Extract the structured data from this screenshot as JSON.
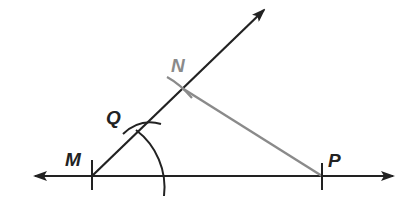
{
  "diagram": {
    "type": "geometric-construction",
    "colors": {
      "primary_stroke": "#222222",
      "secondary_stroke": "#8a8a8a",
      "label_dark": "#222222",
      "label_gray": "#8a8a8a",
      "background": "#ffffff"
    },
    "points": [
      {
        "id": "M",
        "label": "M",
        "x": 92,
        "y": 176,
        "color": "dark"
      },
      {
        "id": "Q",
        "label": "Q",
        "x": 143,
        "y": 124,
        "color": "dark"
      },
      {
        "id": "N",
        "label": "N",
        "x": 182,
        "y": 88,
        "color": "gray"
      },
      {
        "id": "P",
        "label": "P",
        "x": 322,
        "y": 176,
        "color": "dark"
      }
    ],
    "labels": {
      "M": "M",
      "Q": "Q",
      "N": "N",
      "P": "P"
    },
    "lines": [
      {
        "id": "horizontal-line",
        "from": [
          33,
          176
        ],
        "to": [
          395,
          176
        ],
        "arrows": "both"
      },
      {
        "id": "ray-MN",
        "from": [
          92,
          176
        ],
        "to": [
          265,
          8
        ],
        "arrows": "end"
      },
      {
        "id": "segment-NP",
        "from": [
          182,
          88
        ],
        "to": [
          322,
          176
        ],
        "color": "gray"
      }
    ],
    "arcs": [
      {
        "id": "arc-from-M",
        "center": "M",
        "radius": 72,
        "description": "compass arc through Q crossing horizontal line"
      }
    ]
  }
}
